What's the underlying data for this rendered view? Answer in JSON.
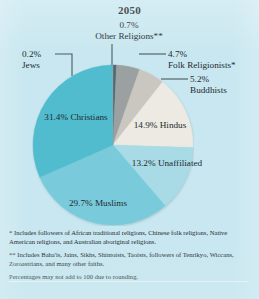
{
  "figure": {
    "title": "2050",
    "background_color": "#c9e7f0"
  },
  "chart_data": {
    "type": "pie",
    "title": "2050",
    "xlabel": "",
    "ylabel": "",
    "categories": [
      "Other Religions**",
      "Folk Religionists*",
      "Buddhists",
      "Hindus",
      "Unaffiliated",
      "Muslims",
      "Christians",
      "Jews"
    ],
    "values": [
      0.7,
      4.7,
      5.2,
      14.9,
      13.2,
      29.7,
      31.4,
      0.2
    ],
    "unit": "%",
    "value_labels": [
      "0.7%",
      "4.7%",
      "5.2%",
      "14.9%",
      "13.2%",
      "29.7%",
      "31.4%",
      "0.2%"
    ],
    "colors": [
      "#4f6b72",
      "#9ba0a0",
      "#c9c7c0",
      "#eceae2",
      "#a9dbe6",
      "#79cbdb",
      "#51bcce",
      "#7fa9b4"
    ],
    "start_angle_deg": 0,
    "direction": "clockwise",
    "legend": "none",
    "labels_placement": "slice-labels-and-callouts",
    "total": 100.0,
    "note": "Percentages may not add to 100 due to rounding."
  },
  "callouts": {
    "other_religions": {
      "pct": "0.7%",
      "name": "Other Religions**"
    },
    "jews": {
      "pct": "0.2%",
      "name": "Jews"
    },
    "folk": {
      "pct": "4.7%",
      "name": "Folk Religionists*"
    },
    "buddhists": {
      "pct": "5.2%",
      "name": "Buddhists"
    }
  },
  "slice_labels": {
    "christians": {
      "pct": "31.4%",
      "name": "Christians"
    },
    "muslims": {
      "pct": "29.7%",
      "name": "Muslims"
    },
    "hindus": {
      "pct": "14.9%",
      "name": "Hindus"
    },
    "unaffiliated": {
      "pct": "13.2%",
      "name": "Unaffiliated"
    }
  },
  "footnotes": {
    "one": "* Includes followers of African traditional religions, Chinese folk religions, Native American religions, and Australian aboriginal religions.",
    "two": "** Includes Baha'is, Jains, Sikhs, Shintoists, Taoists, followers of Tenrikyo, Wiccans, Zoroastrians, and many other faiths.",
    "three": "Percentages may not add to 100 due to rounding."
  }
}
